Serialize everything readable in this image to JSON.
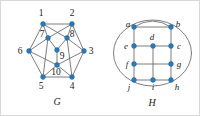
{
  "figure": {
    "caption_left": "G",
    "caption_right": "H",
    "edge_color": "#6e6e6e",
    "vertex_color": "#2b7bba",
    "vertex_stroke": "#1a5a8e",
    "background": "#ffffff",
    "border_color": "#d8d8d8"
  },
  "graph_g": {
    "name": "G",
    "vertices": [
      {
        "id": "1",
        "label": "1",
        "x": 42,
        "y": 23,
        "label_x": 40,
        "label_y": 15
      },
      {
        "id": "2",
        "label": "2",
        "x": 71,
        "y": 23,
        "label_x": 71,
        "label_y": 15
      },
      {
        "id": "3",
        "label": "3",
        "x": 83,
        "y": 50,
        "label_x": 90,
        "label_y": 53
      },
      {
        "id": "4",
        "label": "4",
        "x": 71,
        "y": 76,
        "label_x": 71,
        "label_y": 88
      },
      {
        "id": "5",
        "label": "5",
        "x": 42,
        "y": 76,
        "label_x": 40,
        "label_y": 88
      },
      {
        "id": "6",
        "label": "6",
        "x": 28,
        "y": 50,
        "label_x": 19,
        "label_y": 53
      },
      {
        "id": "7",
        "label": "7",
        "x": 47,
        "y": 37,
        "label_x": 41,
        "label_y": 36
      },
      {
        "id": "8",
        "label": "8",
        "x": 66,
        "y": 37,
        "label_x": 70,
        "label_y": 36
      },
      {
        "id": "9",
        "label": "9",
        "x": 56,
        "y": 49,
        "label_x": 60,
        "label_y": 57
      },
      {
        "id": "10",
        "label": "10",
        "x": 56,
        "y": 64,
        "label_x": 54,
        "label_y": 74
      }
    ],
    "edges": [
      [
        "1",
        "2"
      ],
      [
        "2",
        "3"
      ],
      [
        "3",
        "4"
      ],
      [
        "4",
        "5"
      ],
      [
        "5",
        "6"
      ],
      [
        "6",
        "1"
      ],
      [
        "1",
        "7"
      ],
      [
        "2",
        "8"
      ],
      [
        "1",
        "8"
      ],
      [
        "2",
        "7"
      ],
      [
        "7",
        "9"
      ],
      [
        "8",
        "9"
      ],
      [
        "9",
        "10"
      ],
      [
        "6",
        "7"
      ],
      [
        "3",
        "8"
      ],
      [
        "6",
        "10"
      ],
      [
        "3",
        "10"
      ],
      [
        "7",
        "5"
      ],
      [
        "8",
        "4"
      ],
      [
        "10",
        "5"
      ],
      [
        "10",
        "4"
      ]
    ]
  },
  "graph_h": {
    "name": "H",
    "vertices": [
      {
        "id": "a",
        "label": "a",
        "x": 133,
        "y": 26,
        "label_x": 127,
        "label_y": 25
      },
      {
        "id": "b",
        "label": "b",
        "x": 170,
        "y": 26,
        "label_x": 176,
        "label_y": 25
      },
      {
        "id": "c",
        "label": "c",
        "x": 170,
        "y": 45,
        "label_x": 177,
        "label_y": 48
      },
      {
        "id": "d",
        "label": "d",
        "x": 152,
        "y": 45,
        "label_x": 150,
        "label_y": 38
      },
      {
        "id": "e",
        "label": "e",
        "x": 133,
        "y": 45,
        "label_x": 125,
        "label_y": 48
      },
      {
        "id": "f",
        "label": "f",
        "x": 133,
        "y": 63,
        "label_x": 126,
        "label_y": 66
      },
      {
        "id": "g",
        "label": "g",
        "x": 170,
        "y": 63,
        "label_x": 177,
        "label_y": 66
      },
      {
        "id": "h",
        "label": "h",
        "x": 170,
        "y": 79,
        "label_x": 175,
        "label_y": 89
      },
      {
        "id": "i",
        "label": "i",
        "x": 152,
        "y": 79,
        "label_x": 151,
        "label_y": 89
      },
      {
        "id": "j",
        "label": "j",
        "x": 133,
        "y": 79,
        "label_x": 127,
        "label_y": 89
      }
    ],
    "edges": [
      [
        "a",
        "b"
      ],
      [
        "a",
        "e"
      ],
      [
        "e",
        "f"
      ],
      [
        "f",
        "j"
      ],
      [
        "b",
        "c"
      ],
      [
        "c",
        "g"
      ],
      [
        "g",
        "h"
      ],
      [
        "e",
        "d"
      ],
      [
        "d",
        "c"
      ],
      [
        "f",
        "g"
      ],
      [
        "j",
        "i"
      ],
      [
        "i",
        "h"
      ],
      [
        "d",
        "i"
      ]
    ],
    "curved_edges": [
      {
        "from": "a",
        "to": "b",
        "kind": "arc-over-top"
      },
      {
        "from": "a",
        "to": "j",
        "kind": "outer-left-ellipse"
      },
      {
        "from": "b",
        "to": "h",
        "kind": "outer-right-ellipse"
      },
      {
        "from": "j",
        "to": "h",
        "kind": "outer-bottom-ellipse"
      }
    ]
  }
}
